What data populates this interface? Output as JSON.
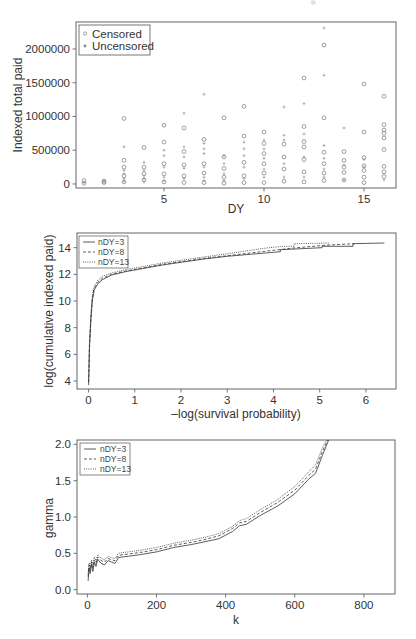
{
  "chart_data": [
    {
      "type": "scatter",
      "title": "",
      "xlabel": "DY",
      "ylabel": "Indexed total paid",
      "xlim": [
        0.6,
        16.6
      ],
      "ylim": [
        -60000,
        2400000
      ],
      "xticks": [
        5,
        10,
        15
      ],
      "yticks": [
        0,
        500000,
        1000000,
        1500000,
        2000000
      ],
      "ytick_labels": [
        "0",
        "500000",
        "1000000",
        "1500000",
        "2000000"
      ],
      "grid": false,
      "legend": {
        "position": "top-left",
        "entries": [
          "Censored",
          "Uncensored"
        ]
      },
      "series": [
        {
          "name": "Censored",
          "marker": "open-circle",
          "points": [
            [
              1,
              50000
            ],
            [
              1,
              10000
            ],
            [
              2,
              40000
            ],
            [
              2,
              20000
            ],
            [
              3,
              970000
            ],
            [
              3,
              350000
            ],
            [
              3,
              250000
            ],
            [
              3,
              120000
            ],
            [
              3,
              30000
            ],
            [
              4,
              540000
            ],
            [
              4,
              250000
            ],
            [
              4,
              150000
            ],
            [
              4,
              60000
            ],
            [
              5,
              870000
            ],
            [
              5,
              620000
            ],
            [
              5,
              300000
            ],
            [
              5,
              150000
            ],
            [
              5,
              30000
            ],
            [
              6,
              830000
            ],
            [
              6,
              480000
            ],
            [
              6,
              280000
            ],
            [
              6,
              120000
            ],
            [
              6,
              20000
            ],
            [
              7,
              660000
            ],
            [
              7,
              300000
            ],
            [
              7,
              160000
            ],
            [
              7,
              20000
            ],
            [
              8,
              980000
            ],
            [
              8,
              400000
            ],
            [
              8,
              230000
            ],
            [
              8,
              100000
            ],
            [
              8,
              10000
            ],
            [
              9,
              1150000
            ],
            [
              9,
              710000
            ],
            [
              9,
              320000
            ],
            [
              9,
              120000
            ],
            [
              9,
              20000
            ],
            [
              10,
              770000
            ],
            [
              10,
              600000
            ],
            [
              10,
              450000
            ],
            [
              10,
              300000
            ],
            [
              10,
              160000
            ],
            [
              10,
              20000
            ],
            [
              11,
              590000
            ],
            [
              11,
              400000
            ],
            [
              11,
              220000
            ],
            [
              11,
              40000
            ],
            [
              12,
              1570000
            ],
            [
              12,
              850000
            ],
            [
              12,
              630000
            ],
            [
              12,
              550000
            ],
            [
              12,
              360000
            ],
            [
              12,
              180000
            ],
            [
              12,
              30000
            ],
            [
              13,
              2060000
            ],
            [
              13,
              980000
            ],
            [
              13,
              470000
            ],
            [
              13,
              300000
            ],
            [
              13,
              160000
            ],
            [
              13,
              50000
            ],
            [
              14,
              480000
            ],
            [
              14,
              350000
            ],
            [
              14,
              250000
            ],
            [
              14,
              170000
            ],
            [
              14,
              60000
            ],
            [
              15,
              1480000
            ],
            [
              15,
              770000
            ],
            [
              15,
              390000
            ],
            [
              15,
              270000
            ],
            [
              15,
              200000
            ],
            [
              15,
              100000
            ],
            [
              15,
              20000
            ],
            [
              16,
              1300000
            ],
            [
              16,
              880000
            ],
            [
              16,
              800000
            ],
            [
              16,
              750000
            ],
            [
              16,
              680000
            ],
            [
              16,
              510000
            ],
            [
              16,
              260000
            ],
            [
              16,
              180000
            ],
            [
              16,
              110000
            ]
          ]
        },
        {
          "name": "Uncensored",
          "marker": "plus",
          "points": [
            [
              1,
              20000
            ],
            [
              2,
              60000
            ],
            [
              2,
              30000
            ],
            [
              3,
              550000
            ],
            [
              3,
              200000
            ],
            [
              3,
              150000
            ],
            [
              3,
              80000
            ],
            [
              3,
              40000
            ],
            [
              4,
              320000
            ],
            [
              4,
              200000
            ],
            [
              4,
              120000
            ],
            [
              4,
              80000
            ],
            [
              4,
              30000
            ],
            [
              5,
              500000
            ],
            [
              5,
              420000
            ],
            [
              5,
              250000
            ],
            [
              5,
              100000
            ],
            [
              5,
              50000
            ],
            [
              6,
              1050000
            ],
            [
              6,
              550000
            ],
            [
              6,
              400000
            ],
            [
              6,
              230000
            ],
            [
              6,
              80000
            ],
            [
              7,
              1330000
            ],
            [
              7,
              600000
            ],
            [
              7,
              520000
            ],
            [
              7,
              450000
            ],
            [
              7,
              250000
            ],
            [
              7,
              100000
            ],
            [
              7,
              50000
            ],
            [
              8,
              420000
            ],
            [
              8,
              300000
            ],
            [
              8,
              150000
            ],
            [
              8,
              50000
            ],
            [
              9,
              620000
            ],
            [
              9,
              520000
            ],
            [
              9,
              420000
            ],
            [
              9,
              250000
            ],
            [
              9,
              80000
            ],
            [
              10,
              650000
            ],
            [
              10,
              520000
            ],
            [
              10,
              380000
            ],
            [
              10,
              220000
            ],
            [
              10,
              100000
            ],
            [
              11,
              1140000
            ],
            [
              11,
              720000
            ],
            [
              11,
              650000
            ],
            [
              11,
              300000
            ],
            [
              11,
              100000
            ],
            [
              12,
              1190000
            ],
            [
              12,
              740000
            ],
            [
              12,
              400000
            ],
            [
              12,
              100000
            ],
            [
              13,
              2310000
            ],
            [
              13,
              1610000
            ],
            [
              13,
              570000
            ],
            [
              13,
              380000
            ],
            [
              13,
              220000
            ],
            [
              13,
              100000
            ],
            [
              14,
              830000
            ],
            [
              14,
              280000
            ],
            [
              14,
              60000
            ],
            [
              15,
              360000
            ],
            [
              15,
              250000
            ],
            [
              16,
              60000
            ]
          ]
        }
      ]
    },
    {
      "type": "line",
      "title": "",
      "xlabel": "–log(survival probability)",
      "ylabel": "log(cumulative indexed paid)",
      "xlim": [
        -0.25,
        6.65
      ],
      "ylim": [
        3.4,
        15.1
      ],
      "xticks": [
        0,
        1,
        2,
        3,
        4,
        5,
        6
      ],
      "yticks": [
        4,
        6,
        8,
        10,
        12,
        14
      ],
      "grid": false,
      "legend": {
        "position": "top-left",
        "entries": [
          "nDY=3",
          "nDY=8",
          "nDY=13"
        ]
      },
      "series": [
        {
          "name": "nDY=3",
          "style": "solid",
          "x": [
            0,
            0.02,
            0.05,
            0.08,
            0.12,
            0.2,
            0.3,
            0.5,
            0.8,
            1.2,
            1.6,
            2.0,
            2.5,
            3.0,
            3.5,
            4.15,
            4.15,
            5.05,
            5.05,
            5.72,
            5.72,
            6.4
          ],
          "y": [
            3.7,
            6.5,
            8.5,
            10.0,
            10.8,
            11.3,
            11.6,
            11.95,
            12.2,
            12.45,
            12.7,
            12.9,
            13.15,
            13.35,
            13.5,
            13.7,
            13.85,
            14.0,
            14.1,
            14.1,
            14.3,
            14.35
          ]
        },
        {
          "name": "nDY=8",
          "style": "dashed",
          "x": [
            0,
            0.02,
            0.05,
            0.08,
            0.12,
            0.2,
            0.3,
            0.5,
            0.8,
            1.2,
            1.6,
            2.0,
            2.5,
            3.0,
            3.5,
            4.0,
            4.5,
            5.2,
            5.75
          ],
          "y": [
            3.9,
            6.8,
            8.8,
            10.2,
            10.9,
            11.4,
            11.7,
            12.0,
            12.25,
            12.5,
            12.75,
            12.95,
            13.2,
            13.4,
            13.6,
            13.8,
            14.0,
            14.2,
            14.3
          ]
        },
        {
          "name": "nDY=13",
          "style": "dotted",
          "x": [
            0,
            0.02,
            0.05,
            0.08,
            0.12,
            0.2,
            0.3,
            0.5,
            0.8,
            1.2,
            1.6,
            2.0,
            2.5,
            3.0,
            3.4,
            3.8,
            4.2,
            4.45,
            4.45,
            5.2
          ],
          "y": [
            4.0,
            7.0,
            9.0,
            10.4,
            11.1,
            11.55,
            11.85,
            12.1,
            12.35,
            12.6,
            12.85,
            13.05,
            13.3,
            13.55,
            13.75,
            13.95,
            14.1,
            14.1,
            14.3,
            14.35
          ]
        }
      ]
    },
    {
      "type": "line",
      "title": "",
      "xlabel": "k",
      "ylabel": "gamma",
      "xlim": [
        -30,
        890
      ],
      "ylim": [
        -0.06,
        2.06
      ],
      "xticks": [
        0,
        200,
        400,
        600,
        800
      ],
      "yticks": [
        0.0,
        0.5,
        1.0,
        1.5,
        2.0
      ],
      "ytick_labels": [
        "0.0",
        "0.5",
        "1.0",
        "1.5",
        "2.0"
      ],
      "grid": false,
      "legend": {
        "position": "top-left",
        "entries": [
          "nDY=3",
          "nDY=8",
          "nDY=13"
        ]
      },
      "series": [
        {
          "name": "nDY=3",
          "style": "solid",
          "x": [
            2,
            5,
            8,
            12,
            16,
            20,
            25,
            30,
            40,
            50,
            60,
            70,
            80,
            90,
            100,
            120,
            150,
            200,
            250,
            300,
            340,
            380,
            420,
            440,
            460,
            500,
            550,
            600,
            640,
            660,
            680,
            700
          ],
          "y": [
            0.12,
            0.3,
            0.22,
            0.35,
            0.25,
            0.38,
            0.32,
            0.42,
            0.36,
            0.34,
            0.4,
            0.38,
            0.36,
            0.44,
            0.45,
            0.46,
            0.48,
            0.52,
            0.58,
            0.62,
            0.66,
            0.7,
            0.8,
            0.88,
            0.9,
            1.02,
            1.15,
            1.32,
            1.52,
            1.6,
            1.85,
            2.08
          ]
        },
        {
          "name": "nDY=8",
          "style": "dashed",
          "x": [
            2,
            5,
            8,
            12,
            16,
            20,
            25,
            30,
            40,
            50,
            60,
            70,
            80,
            90,
            100,
            120,
            150,
            200,
            250,
            300,
            340,
            380,
            420,
            440,
            460,
            500,
            550,
            600,
            640,
            660,
            680,
            697
          ],
          "y": [
            0.18,
            0.34,
            0.26,
            0.38,
            0.3,
            0.41,
            0.36,
            0.45,
            0.4,
            0.38,
            0.43,
            0.41,
            0.4,
            0.47,
            0.48,
            0.49,
            0.51,
            0.55,
            0.61,
            0.65,
            0.69,
            0.74,
            0.84,
            0.92,
            0.94,
            1.06,
            1.2,
            1.37,
            1.57,
            1.66,
            1.9,
            2.08
          ]
        },
        {
          "name": "nDY=13",
          "style": "dotted",
          "x": [
            2,
            5,
            8,
            12,
            16,
            20,
            25,
            30,
            40,
            50,
            60,
            70,
            80,
            90,
            100,
            120,
            150,
            200,
            250,
            300,
            340,
            380,
            420,
            440,
            460,
            500,
            550,
            600,
            640,
            660,
            680,
            694
          ],
          "y": [
            0.22,
            0.37,
            0.3,
            0.41,
            0.34,
            0.45,
            0.4,
            0.48,
            0.43,
            0.41,
            0.46,
            0.44,
            0.43,
            0.5,
            0.51,
            0.52,
            0.54,
            0.58,
            0.64,
            0.68,
            0.72,
            0.77,
            0.87,
            0.95,
            0.98,
            1.1,
            1.24,
            1.42,
            1.62,
            1.72,
            1.95,
            2.08
          ]
        }
      ]
    }
  ],
  "panels": [
    {
      "box": [
        76,
        22,
        396,
        188
      ]
    },
    {
      "box": [
        77,
        233,
        396,
        389
      ]
    },
    {
      "box": [
        77,
        440,
        395,
        594
      ]
    }
  ],
  "colors": {
    "axis": "#555555",
    "censored": "#777777",
    "uncensored": "#999999",
    "line": "#333333",
    "text": "#333333"
  },
  "header_fragment": "ijk"
}
